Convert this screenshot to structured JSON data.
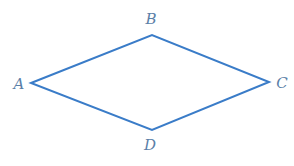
{
  "figure": {
    "shape": "rhombus",
    "stroke_color": "#3a7cc8",
    "label_color": "#5b7fa8",
    "vertices": [
      {
        "name": "A",
        "x": 31,
        "y": 83,
        "label_x": 19,
        "label_y": 84
      },
      {
        "name": "B",
        "x": 152,
        "y": 35,
        "label_x": 151,
        "label_y": 19
      },
      {
        "name": "C",
        "x": 269,
        "y": 82,
        "label_x": 282,
        "label_y": 83
      },
      {
        "name": "D",
        "x": 152,
        "y": 130,
        "label_x": 150,
        "label_y": 145
      }
    ],
    "labels": {
      "A": "A",
      "B": "B",
      "C": "C",
      "D": "D"
    }
  }
}
